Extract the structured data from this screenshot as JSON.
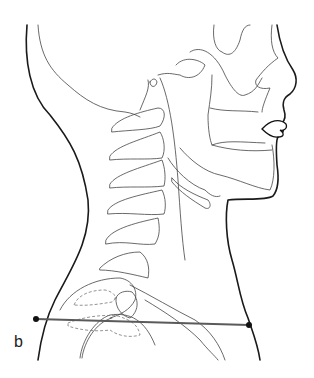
{
  "figure": {
    "panel_label": "b",
    "reference_line": {
      "start": [
        36,
        319
      ],
      "end": [
        249,
        325
      ],
      "color": "#5a5a5a"
    },
    "colors": {
      "outline": "#1a1a1a",
      "bone": "#444444",
      "hidden": "#777777",
      "background": "#ffffff"
    }
  }
}
